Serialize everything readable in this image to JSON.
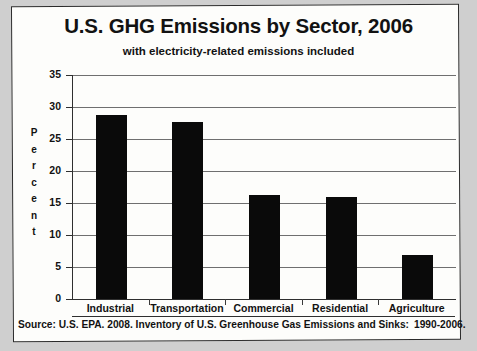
{
  "chart_data": {
    "type": "bar",
    "title": "U.S. GHG Emissions by Sector, 2006",
    "subtitle": "with electricity-related emissions included",
    "categories": [
      "Industrial",
      "Transportation",
      "Commercial",
      "Residential",
      "Agriculture"
    ],
    "values": [
      28.8,
      27.6,
      16.2,
      16.0,
      6.8
    ],
    "xlabel": "",
    "ylabel": "Percent",
    "ylim": [
      0,
      35
    ],
    "ytick_step": 5,
    "yticks": [
      "35",
      "30",
      "25",
      "20",
      "15",
      "10",
      "5",
      "0"
    ],
    "grid": true,
    "legend": false,
    "bar_color": "#0a0a0a",
    "source": "Source: U.S. EPA. 2008. Inventory of U.S. Greenhouse Gas Emissions and Sinks:",
    "source_years": "1990-2006."
  },
  "axis_title_letters": [
    "P",
    "e",
    "r",
    "c",
    "e",
    "n",
    "t"
  ]
}
